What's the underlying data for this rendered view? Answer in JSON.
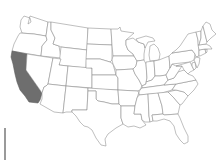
{
  "map": {
    "title": "United States map with California highlighted",
    "highlighted_state": "California",
    "highlight_color": "#6e6e6e",
    "base_fill": "#ffffff",
    "border_color": "#8a8a8a",
    "states": [
      "Washington",
      "Oregon",
      "California",
      "Idaho",
      "Nevada",
      "Montana",
      "Wyoming",
      "Utah",
      "Arizona",
      "Colorado",
      "New Mexico",
      "North Dakota",
      "South Dakota",
      "Nebraska",
      "Kansas",
      "Oklahoma",
      "Texas",
      "Minnesota",
      "Iowa",
      "Missouri",
      "Arkansas",
      "Louisiana",
      "Wisconsin",
      "Illinois",
      "Michigan",
      "Indiana",
      "Ohio",
      "Kentucky",
      "Tennessee",
      "Mississippi",
      "Alabama",
      "Georgia",
      "Florida",
      "South Carolina",
      "North Carolina",
      "Virginia",
      "West Virginia",
      "Pennsylvania",
      "New York",
      "Maryland",
      "Delaware",
      "New Jersey",
      "Connecticut",
      "Rhode Island",
      "Massachusetts",
      "Vermont",
      "New Hampshire",
      "Maine"
    ]
  },
  "scale_bar": {
    "visible": true
  }
}
